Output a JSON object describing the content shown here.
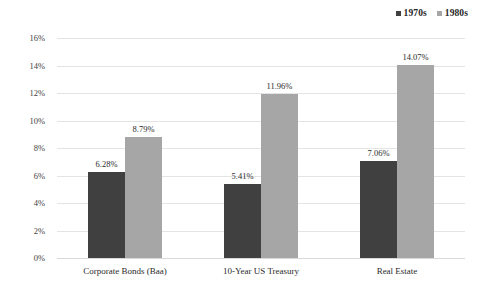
{
  "chart_data": {
    "type": "bar",
    "title": "",
    "subtitle": "",
    "xlabel": "",
    "ylabel": "10-Year Annualized Return",
    "categories": [
      "Corporate Bonds (Baa)",
      "10-Year US Treasury",
      "Real Estate"
    ],
    "series": [
      {
        "name": "1970s",
        "color": "#404040",
        "values": [
          6.28,
          5.41,
          7.06
        ],
        "labels": [
          "6.28%",
          "5.41%",
          "7.06%"
        ]
      },
      {
        "name": "1980s",
        "color": "#a6a6a6",
        "values": [
          8.79,
          11.96,
          14.07
        ],
        "labels": [
          "8.79%",
          "11.96%",
          "14.07%"
        ]
      }
    ],
    "ylim": [
      0,
      16
    ],
    "ytick_step": 2,
    "ytick_labels": [
      "16%",
      "14%",
      "12%",
      "10%",
      "8%",
      "6%",
      "4%",
      "2%",
      "0%"
    ],
    "ytick_values": [
      16,
      14,
      12,
      10,
      8,
      6,
      4,
      2,
      0
    ],
    "grid": true,
    "grid_color": "#e4e4e4",
    "legend_position": "top-right",
    "background": "#ffffff",
    "value_labels_shown": true,
    "units": "percent"
  },
  "legend": {
    "entries": [
      {
        "label": "1970s",
        "color": "#404040",
        "marker": "square-marker"
      },
      {
        "label": "1980s",
        "color": "#a6a6a6",
        "marker": "square-marker"
      }
    ]
  }
}
